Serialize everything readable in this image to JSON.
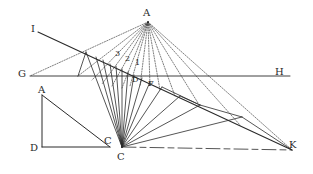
{
  "diagram": {
    "type": "geometric-perspective-construction",
    "ink_color": "#2a2a2a",
    "labels": {
      "A_top": "A",
      "I": "I",
      "G": "G",
      "H": "H",
      "three": "3",
      "two": "2",
      "one": "1",
      "D_mid": "D",
      "F": "F",
      "A_left": "A",
      "D_left": "D",
      "C_small": "C",
      "C_main": "C",
      "K": "K"
    },
    "points": {
      "A_top": [
        148,
        22
      ],
      "I_end": [
        38,
        32
      ],
      "G_end": [
        30,
        76
      ],
      "H_end": [
        290,
        76
      ],
      "C_main": [
        122,
        147
      ],
      "K": [
        292,
        150
      ],
      "A_left": [
        42,
        95
      ],
      "D_left": [
        42,
        147
      ],
      "C_small": [
        110,
        147
      ]
    }
  }
}
